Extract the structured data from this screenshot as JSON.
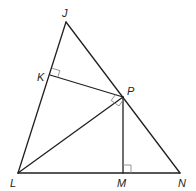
{
  "diagram": {
    "type": "geometry",
    "points": {
      "J": {
        "label": "J",
        "x": 66,
        "y": 22
      },
      "K": {
        "label": "K",
        "x": 50,
        "y": 75
      },
      "P": {
        "label": "P",
        "x": 123,
        "y": 97
      },
      "L": {
        "label": "L",
        "x": 18,
        "y": 173
      },
      "M": {
        "label": "M",
        "x": 123,
        "y": 173
      },
      "N": {
        "label": "N",
        "x": 180,
        "y": 173
      }
    },
    "segments": [
      "JL",
      "JN",
      "LN",
      "KP",
      "LP",
      "PM"
    ],
    "right_angles": [
      "K",
      "P",
      "M"
    ],
    "colors": {
      "line": "#231f20",
      "mark": "#8a8a8a",
      "background": "#ffffff"
    }
  }
}
